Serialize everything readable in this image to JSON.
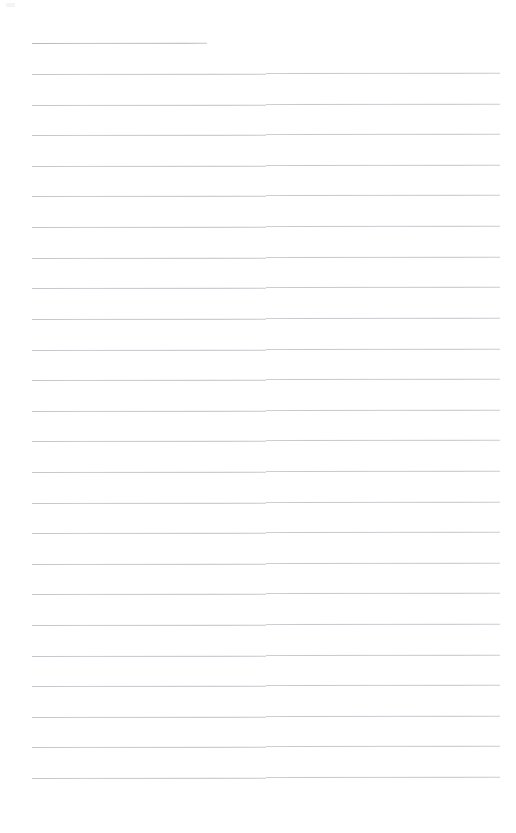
{
  "document": {
    "kind": "blank-ruled-page",
    "page_background": "#ffffff",
    "rule_color": "#c9c9cd",
    "page_width": 516,
    "page_height": 833,
    "text_content": "",
    "visible_text": [],
    "body_text": ""
  },
  "layout": {
    "left_margin_x": 32,
    "right_margin_x": 500,
    "top_margin_y": 36,
    "column_break_x": 266,
    "line_spacing": 30.6,
    "first_line_y": 43,
    "last_line_y": 778,
    "line_count": 25,
    "title_rule_end_x": 207,
    "bottom_whitespace_y": 790
  },
  "rules": [
    {
      "index": 0,
      "y": 43,
      "full_width": false,
      "end_x": 207
    },
    {
      "index": 1,
      "y": 74,
      "full_width": true,
      "end_x": 500
    },
    {
      "index": 2,
      "y": 105,
      "full_width": true,
      "end_x": 500
    },
    {
      "index": 3,
      "y": 135,
      "full_width": true,
      "end_x": 500
    },
    {
      "index": 4,
      "y": 166,
      "full_width": true,
      "end_x": 500
    },
    {
      "index": 5,
      "y": 196,
      "full_width": true,
      "end_x": 500
    },
    {
      "index": 6,
      "y": 227,
      "full_width": true,
      "end_x": 500
    },
    {
      "index": 7,
      "y": 258,
      "full_width": true,
      "end_x": 500
    },
    {
      "index": 8,
      "y": 288,
      "full_width": true,
      "end_x": 500
    },
    {
      "index": 9,
      "y": 319,
      "full_width": true,
      "end_x": 500
    },
    {
      "index": 10,
      "y": 350,
      "full_width": true,
      "end_x": 500
    },
    {
      "index": 11,
      "y": 380,
      "full_width": true,
      "end_x": 500
    },
    {
      "index": 12,
      "y": 411,
      "full_width": true,
      "end_x": 500
    },
    {
      "index": 13,
      "y": 441,
      "full_width": true,
      "end_x": 500
    },
    {
      "index": 14,
      "y": 472,
      "full_width": true,
      "end_x": 500
    },
    {
      "index": 15,
      "y": 503,
      "full_width": true,
      "end_x": 500
    },
    {
      "index": 16,
      "y": 533,
      "full_width": true,
      "end_x": 500
    },
    {
      "index": 17,
      "y": 564,
      "full_width": true,
      "end_x": 500
    },
    {
      "index": 18,
      "y": 594,
      "full_width": true,
      "end_x": 500
    },
    {
      "index": 19,
      "y": 625,
      "full_width": true,
      "end_x": 500
    },
    {
      "index": 20,
      "y": 656,
      "full_width": true,
      "end_x": 500
    },
    {
      "index": 21,
      "y": 686,
      "full_width": true,
      "end_x": 500
    },
    {
      "index": 22,
      "y": 717,
      "full_width": true,
      "end_x": 500
    },
    {
      "index": 23,
      "y": 747,
      "full_width": true,
      "end_x": 500
    },
    {
      "index": 24,
      "y": 778,
      "full_width": true,
      "end_x": 500
    }
  ]
}
